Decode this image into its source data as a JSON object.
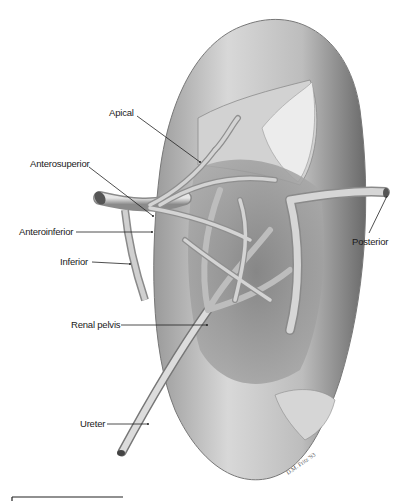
{
  "figure": {
    "labels": {
      "apical": "Apical",
      "anterosuperior": "Anterosuperior",
      "anteroinferior": "Anteroinferior",
      "inferior": "Inferior",
      "posterior": "Posterior",
      "renal_pelvis": "Renal pelvis",
      "ureter": "Ureter"
    },
    "signature": "D.M. Fritz '93"
  },
  "colors": {
    "background": "#ffffff",
    "label_text": "#1a1a1a",
    "leader_line": "#222222",
    "kidney_light": "#e8e8e8",
    "kidney_dark": "#6e6e6e",
    "vessel": "#b5b5b5"
  }
}
